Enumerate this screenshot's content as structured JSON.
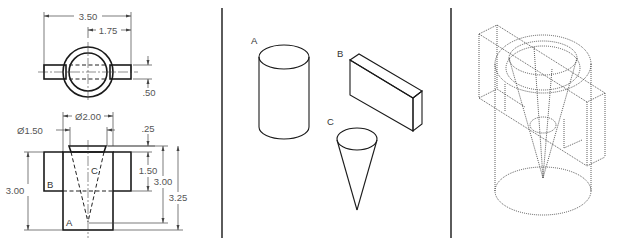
{
  "figure": {
    "panels": [
      {
        "id": "orthographic",
        "title": "Multiview drawing"
      },
      {
        "id": "primitives",
        "title": "Exploded primitives"
      },
      {
        "id": "wireframe",
        "title": "Combined wireframe"
      }
    ]
  },
  "top_view": {
    "dims": {
      "overall_width": "3.50",
      "half_width": "1.75",
      "arm_thickness": ".50"
    }
  },
  "front_view": {
    "dims": {
      "outer_diameter": "Ø2.00",
      "cone_diameter": "Ø1.50",
      "cone_offset": ".25",
      "box_height": "1.50",
      "left_height": "3.00",
      "right_height": "3.00",
      "total_height": "3.25"
    },
    "labels": {
      "a": "A",
      "b": "B",
      "c": "C"
    }
  },
  "primitives": {
    "cylinder_label": "A",
    "box_label": "B",
    "cone_label": "C"
  },
  "colors": {
    "background": "#ffffff",
    "line": "#1a1a1a",
    "dimension": "#555555"
  }
}
